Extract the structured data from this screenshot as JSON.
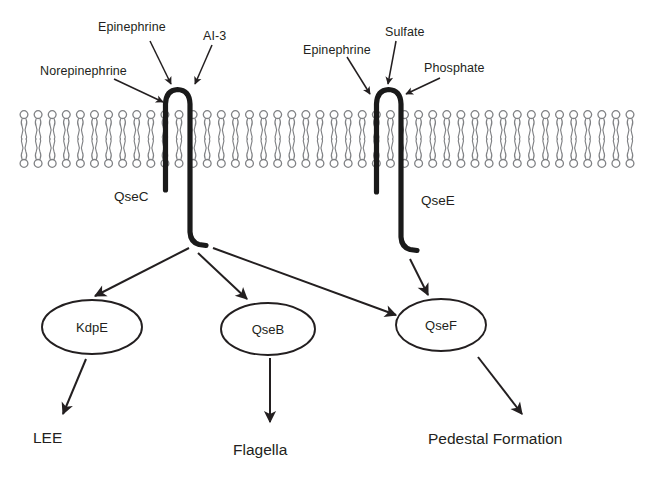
{
  "figure": {
    "background_color": "#ffffff",
    "ink_color": "#231f20",
    "membrane_color": "#808285"
  },
  "membrane": {
    "name": "phospholipid-bilayer",
    "lipid_count": 44,
    "x_start": 24,
    "x_end": 630,
    "top_y": 110,
    "bottom_y": 168
  },
  "receptors": [
    {
      "id": "qsec",
      "label": "QseC",
      "label_x": 114,
      "label_y": 190
    },
    {
      "id": "qsee",
      "label": "QseE",
      "label_x": 421,
      "label_y": 194
    }
  ],
  "ligands": [
    {
      "id": "norepinephrine",
      "label": "Norepinephrine",
      "label_x": 40,
      "label_y": 65,
      "target": "QseC"
    },
    {
      "id": "epinephrine-left",
      "label": "Epinephrine",
      "label_x": 98,
      "label_y": 21,
      "target": "QseC"
    },
    {
      "id": "ai-3",
      "label": "AI-3",
      "label_x": 203,
      "label_y": 30,
      "target": "QseC"
    },
    {
      "id": "epinephrine-right",
      "label": "Epinephrine",
      "label_x": 303,
      "label_y": 44,
      "target": "QseE"
    },
    {
      "id": "sulfate",
      "label": "Sulfate",
      "label_x": 385,
      "label_y": 26,
      "target": "QseE"
    },
    {
      "id": "phosphate",
      "label": "Phosphate",
      "label_x": 424,
      "label_y": 62,
      "target": "QseE"
    }
  ],
  "nodes": [
    {
      "id": "kdpe",
      "label": "KdpE",
      "cx": 92,
      "cy": 327,
      "rx": 50,
      "ry": 27
    },
    {
      "id": "qseb",
      "label": "QseB",
      "cx": 268,
      "cy": 329,
      "rx": 47,
      "ry": 26
    },
    {
      "id": "qsef",
      "label": "QseF",
      "cx": 441,
      "cy": 325,
      "rx": 45,
      "ry": 26
    }
  ],
  "outputs": [
    {
      "id": "lee",
      "label": "LEE",
      "label_x": 33,
      "label_y": 430,
      "from": "kdpe"
    },
    {
      "id": "flagella",
      "label": "Flagella",
      "label_x": 233,
      "label_y": 442,
      "from": "qseb"
    },
    {
      "id": "pedestal-formation",
      "label": "Pedestal Formation",
      "label_x": 428,
      "label_y": 431,
      "from": "qsef"
    }
  ],
  "signal_arrows": [
    {
      "id": "qsec-to-kdpe",
      "from": "QseC",
      "to": "KdpE"
    },
    {
      "id": "qsec-to-qseb",
      "from": "QseC",
      "to": "QseB"
    },
    {
      "id": "qsec-to-qsef",
      "from": "QseC",
      "to": "QseF"
    },
    {
      "id": "qsee-to-qsef",
      "from": "QseE",
      "to": "QseF"
    },
    {
      "id": "kdpe-to-lee",
      "from": "KdpE",
      "to": "LEE"
    },
    {
      "id": "qseb-to-flagella",
      "from": "QseB",
      "to": "Flagella"
    },
    {
      "id": "qsef-to-pedestal",
      "from": "QseF",
      "to": "Pedestal Formation"
    }
  ],
  "footer": {
    "cropped_caption": "  "
  }
}
